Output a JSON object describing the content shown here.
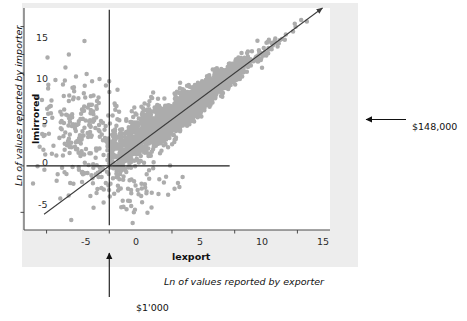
{
  "chart_data": {
    "type": "scatter",
    "title": "",
    "xlabel": "lexport",
    "ylabel": "lmirrored",
    "xlabel_description": "Ln of values reported by exporter",
    "ylabel_description": "Ln of values reported by importer",
    "xlim": [
      -6.8,
      17.6
    ],
    "ylim": [
      -6.9,
      17.0
    ],
    "xticks": [
      -5,
      0,
      5,
      10,
      15
    ],
    "xticklabels": [
      "-5",
      "0",
      "5",
      "10",
      "15"
    ],
    "yticks": [
      -5,
      0,
      5,
      10,
      15
    ],
    "yticklabels": [
      "-5",
      "0",
      "5",
      "10",
      "15"
    ],
    "grid": false,
    "legend": null,
    "marker_color": "#9a9a9a",
    "marker_size": 3.1,
    "reference_lines": [
      {
        "name": "identity-line",
        "kind": "diagonal",
        "slope": 1,
        "intercept": 0,
        "x_from": -5.2,
        "x_to": 17.0,
        "arrow_end": true,
        "color": "#3c3c3c"
      },
      {
        "name": "vertical-zero-line",
        "kind": "vertical",
        "x": 0,
        "y_from": -6.4,
        "y_to": 16.8,
        "color": "#1c1c1c"
      },
      {
        "name": "horizontal-zero-line",
        "kind": "horizontal",
        "y": 0,
        "x_from": -6.6,
        "x_to": 9.6,
        "color": "#1c1c1c"
      }
    ],
    "annotations": [
      {
        "name": "x-zero-callout",
        "text": "$1'000",
        "points_to": "x = 0 on lexport axis",
        "arrow_direction": "up"
      },
      {
        "name": "y-five-callout",
        "text": "$148,000",
        "points_to": "y = 5 on lmirrored axis",
        "arrow_direction": "left"
      }
    ],
    "n_points": 2600,
    "cluster": {
      "main": {
        "share": 0.88,
        "x_mean": 5.4,
        "x_sd": 3.1,
        "x_min": -0.2,
        "x_max": 17.0,
        "residual_sd_base": 1.25,
        "residual_sd_slope": -0.062
      },
      "left_tail": {
        "share": 0.09,
        "x_mean": -2.1,
        "x_sd": 1.9,
        "x_min": -6.2,
        "x_max": 1.2,
        "y_mean": 3.6,
        "y_sd": 3.0
      },
      "low_scatter": {
        "share": 0.03,
        "x_mean": 1.8,
        "x_sd": 2.4,
        "x_min": -3.6,
        "x_max": 8.0,
        "y_mean": -2.4,
        "y_sd": 1.8
      }
    },
    "seed": 20240517
  },
  "geometry": {
    "figure": {
      "x": 22,
      "y": 3,
      "w": 336,
      "h": 264,
      "bg": "#ededed"
    },
    "panel": {
      "x": 24,
      "y": 8,
      "w": 306,
      "h": 222,
      "bg": "#ffffff"
    },
    "axis_color": "#4a4a4a",
    "text_color": "#111111"
  },
  "labels": {
    "y_tick_15": "15",
    "y_tick_10": "10",
    "y_tick_5": "5",
    "y_tick_0": "0",
    "y_tick_m5": "-5",
    "x_tick_m5": "-5",
    "x_tick_0": "0",
    "x_tick_5": "5",
    "x_tick_10": "10",
    "x_tick_15": "15",
    "x_axis_name": "lexport",
    "y_axis_name": "lmirrored",
    "x_axis_description": "Ln of values reported by exporter",
    "y_axis_description": "Ln of values reported by importer",
    "callout_bottom": "$1'000",
    "callout_right": "$148,000"
  }
}
